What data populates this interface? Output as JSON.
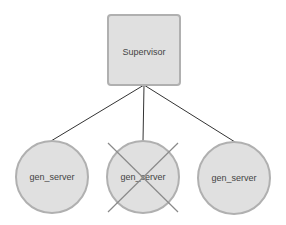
{
  "diagram": {
    "supervisor": {
      "label": "Supervisor"
    },
    "workers": [
      {
        "label": "gen_server",
        "crashed": false
      },
      {
        "label": "gen_server",
        "crashed": true
      },
      {
        "label": "gen_server",
        "crashed": false
      }
    ],
    "colors": {
      "node_fill": "#e0e0e0",
      "node_stroke": "#b0b0b0",
      "edge": "#333333",
      "cross": "#8a8a8a"
    }
  }
}
